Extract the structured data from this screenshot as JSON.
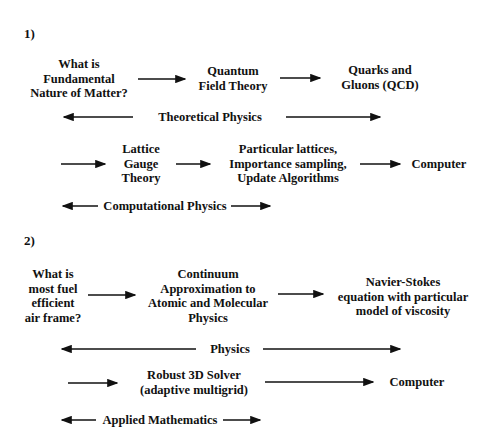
{
  "section1": {
    "label": "1)",
    "nodes": {
      "question": [
        "What is",
        "Fundamental",
        "Nature of Matter?"
      ],
      "qft": [
        "Quantum",
        "Field Theory"
      ],
      "qcd": [
        "Quarks and",
        "Gluons (QCD)"
      ],
      "lattice": [
        "Lattice",
        "Gauge",
        "Theory"
      ],
      "algorithms": [
        "Particular lattices,",
        "Importance sampling,",
        "Update Algorithms"
      ],
      "computer": "Computer"
    },
    "spans": {
      "theoretical": "Theoretical Physics",
      "computational": "Computational Physics"
    }
  },
  "section2": {
    "label": "2)",
    "nodes": {
      "question": [
        "What is",
        "most fuel",
        "efficient",
        "air frame?"
      ],
      "continuum": [
        "Continuum",
        "Approximation to",
        "Atomic and Molecular",
        "Physics"
      ],
      "navier": [
        "Navier-Stokes",
        "equation with particular",
        "model of viscosity"
      ],
      "solver": [
        "Robust 3D Solver",
        "(adaptive multigrid)"
      ],
      "computer": "Computer"
    },
    "spans": {
      "physics": "Physics",
      "applied_math": "Applied Mathematics"
    }
  },
  "colors": {
    "ink": "#111111",
    "background": "#ffffff"
  }
}
